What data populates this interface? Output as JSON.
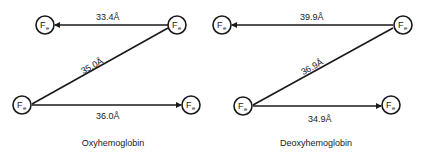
{
  "node_label": "F",
  "node_subscript": "e",
  "diagrams": [
    {
      "caption": "Oxyhemoglobin",
      "distances": {
        "top": "33.4Å",
        "diagonal": "35.0Å",
        "bottom": "36.0Å"
      }
    },
    {
      "caption": "Deoxyhemoglobin",
      "distances": {
        "top": "39.9Å",
        "diagonal": "36.9Å",
        "bottom": "34.9Å"
      }
    }
  ],
  "colors": {
    "stroke": "#1a1a1a",
    "background": "#ffffff"
  }
}
